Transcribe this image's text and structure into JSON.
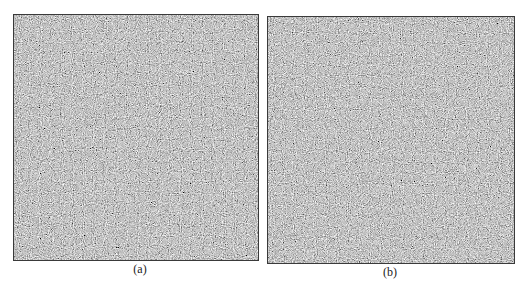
{
  "figure": {
    "panels": [
      {
        "label": "(a)",
        "description": "random-dot noise texture",
        "base_color": "#8c8c8c"
      },
      {
        "label": "(b)",
        "description": "random-dot noise texture",
        "base_color": "#8c8c8c"
      }
    ]
  }
}
